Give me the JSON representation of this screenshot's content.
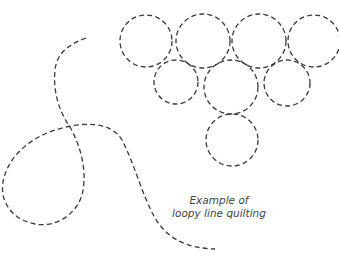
{
  "caption": {
    "line1": "Example of",
    "line2": "loopy line quilting"
  },
  "colors": {
    "stitch": "#3a3a3a",
    "text": "#444444",
    "background": "#ffffff"
  },
  "circles": [
    {
      "cx": 146,
      "cy": 41,
      "r": 26
    },
    {
      "cx": 203,
      "cy": 41,
      "r": 27
    },
    {
      "cx": 259,
      "cy": 41,
      "r": 27
    },
    {
      "cx": 314,
      "cy": 41,
      "r": 26
    },
    {
      "cx": 176,
      "cy": 82,
      "r": 22
    },
    {
      "cx": 231,
      "cy": 87,
      "r": 27
    },
    {
      "cx": 287,
      "cy": 83,
      "r": 23
    },
    {
      "cx": 232,
      "cy": 140,
      "r": 26
    }
  ]
}
